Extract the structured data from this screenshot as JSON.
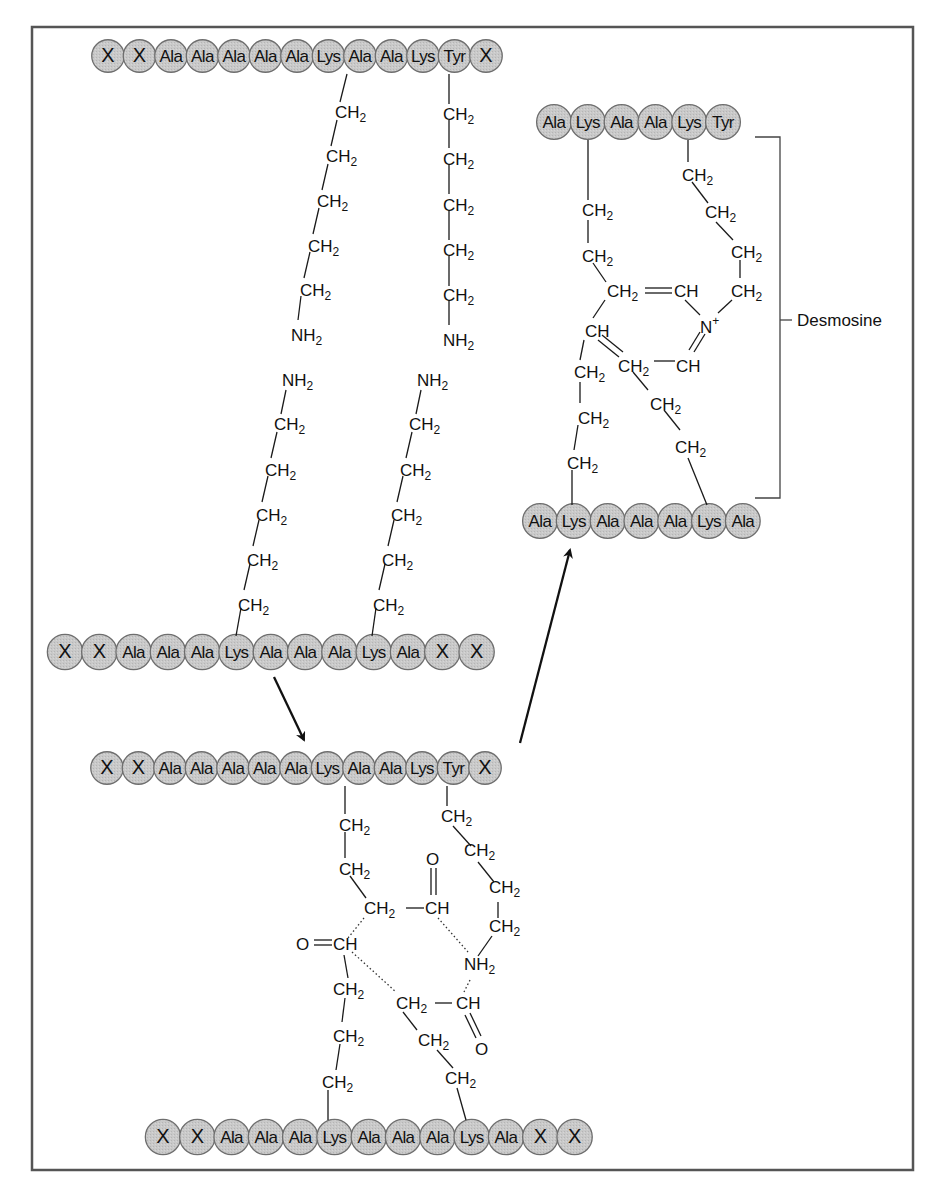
{
  "figure": {
    "frame": {
      "x": 32,
      "y": 27,
      "w": 881,
      "h": 1143,
      "stroke": "#555555"
    },
    "residue_fill": "#c8c8c8",
    "residue_stroke": "#6e6e6e",
    "bond_color": "#1a1a1a",
    "arrow_color": "#111111"
  },
  "chains": {
    "top_chain_1": {
      "x0": 108,
      "y": 56,
      "step": 31.5,
      "residues": [
        "X",
        "X",
        "Ala",
        "Ala",
        "Ala",
        "Ala",
        "Ala",
        "Lys",
        "Ala",
        "Ala",
        "Lys",
        "Tyr",
        "X"
      ]
    },
    "mid_chain_2": {
      "x0": 65,
      "y": 652,
      "step": 34.3,
      "residues": [
        "X",
        "X",
        "Ala",
        "Ala",
        "Ala",
        "Lys",
        "Ala",
        "Ala",
        "Ala",
        "Lys",
        "Ala",
        "X",
        "X"
      ]
    },
    "crosslink_top_chain": {
      "x0": 107,
      "y": 768,
      "step": 31.5,
      "residues": [
        "X",
        "X",
        "Ala",
        "Ala",
        "Ala",
        "Ala",
        "Ala",
        "Lys",
        "Ala",
        "Ala",
        "Lys",
        "Tyr",
        "X"
      ]
    },
    "crosslink_bottom_chain": {
      "x0": 163,
      "y": 1137,
      "step": 34.3,
      "residues": [
        "X",
        "X",
        "Ala",
        "Ala",
        "Ala",
        "Lys",
        "Ala",
        "Ala",
        "Ala",
        "Lys",
        "Ala",
        "X",
        "X"
      ]
    },
    "desmosine_top_chain": {
      "x0": 554,
      "y": 122,
      "step": 33.8,
      "residues": [
        "Ala",
        "Lys",
        "Ala",
        "Ala",
        "Lys",
        "Tyr"
      ]
    },
    "desmosine_bottom_chain": {
      "x0": 540,
      "y": 521,
      "step": 33.8,
      "residues": [
        "Ala",
        "Lys",
        "Ala",
        "Ala",
        "Ala",
        "Lys",
        "Ala"
      ]
    }
  },
  "side_chains": {
    "panel1_upper_left": [
      "CH2",
      "CH2",
      "CH2",
      "CH2",
      "CH2",
      "NH2"
    ],
    "panel1_upper_right": [
      "CH2",
      "CH2",
      "CH2",
      "CH2",
      "CH2",
      "NH2"
    ],
    "panel1_lower_left": [
      "NH2",
      "CH2",
      "CH2",
      "CH2",
      "CH2",
      "CH2"
    ],
    "panel1_lower_right": [
      "NH2",
      "CH2",
      "CH2",
      "CH2",
      "CH2",
      "CH2"
    ]
  },
  "labels": {
    "ch2": "CH2",
    "ch": "CH",
    "nh2": "NH2",
    "o": "O",
    "n_plus": "N+",
    "desmosine": "Desmosine"
  },
  "arrows": [
    {
      "name": "arrow-to-crosslink",
      "from": [
        274,
        677
      ],
      "to": [
        305,
        742
      ]
    },
    {
      "name": "arrow-to-desmosine",
      "from": [
        520,
        743
      ],
      "to": [
        571,
        548
      ]
    }
  ]
}
